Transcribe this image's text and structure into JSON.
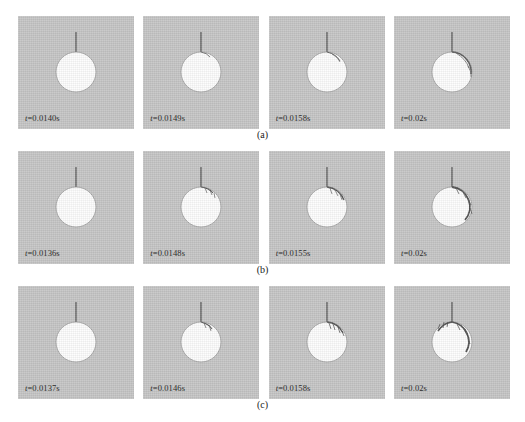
{
  "figure": {
    "type": "image-sequence-grid",
    "rows": 3,
    "columns": 4,
    "panel_background_color": "#c6c6c6",
    "bubble_color": "#fdfdfd",
    "needle_color": "#6e6e6e",
    "streamer_color": "#4a4a4a"
  },
  "rows": [
    {
      "caption": "(a)",
      "panels": [
        {
          "time_label": "t =0.0140s",
          "time_prefix": "t",
          "time_value": "=0.0140s",
          "bubble_radius": 20,
          "bubble_cx": 58,
          "bubble_cy": 56,
          "needle_length": 20,
          "arc_extent": "none",
          "streamer_branches": 0
        },
        {
          "time_label": "t =0.0149s",
          "time_prefix": "t",
          "time_value": "=0.0149s",
          "bubble_radius": 20,
          "bubble_cx": 58,
          "bubble_cy": 56,
          "needle_length": 20,
          "arc_extent": "none",
          "streamer_branches": 0
        },
        {
          "time_label": "t =0.0158s",
          "time_prefix": "t",
          "time_value": "=0.0158s",
          "bubble_radius": 20,
          "bubble_cx": 58,
          "bubble_cy": 56,
          "needle_length": 20,
          "arc_extent": "small",
          "streamer_branches": 1
        },
        {
          "time_label": "t =0.02s",
          "time_prefix": "t",
          "time_value": "=0.02s",
          "bubble_radius": 20,
          "bubble_cx": 58,
          "bubble_cy": 56,
          "needle_length": 20,
          "arc_extent": "right",
          "streamer_branches": 2
        }
      ]
    },
    {
      "caption": "(b)",
      "panels": [
        {
          "time_label": "t =0.0136s",
          "time_prefix": "t",
          "time_value": "=0.0136s",
          "bubble_radius": 20,
          "bubble_cx": 58,
          "bubble_cy": 56,
          "needle_length": 20,
          "arc_extent": "none",
          "streamer_branches": 0
        },
        {
          "time_label": "t =0.0148s",
          "time_prefix": "t",
          "time_value": "=0.0148s",
          "bubble_radius": 20,
          "bubble_cx": 58,
          "bubble_cy": 56,
          "needle_length": 20,
          "arc_extent": "small",
          "streamer_branches": 2
        },
        {
          "time_label": "t =0.0155s",
          "time_prefix": "t",
          "time_value": "=0.0155s",
          "bubble_radius": 20,
          "bubble_cx": 58,
          "bubble_cy": 56,
          "needle_length": 20,
          "arc_extent": "medium",
          "streamer_branches": 3
        },
        {
          "time_label": "t =0.02s",
          "time_prefix": "t",
          "time_value": "=0.02s",
          "bubble_radius": 20,
          "bubble_cx": 58,
          "bubble_cy": 56,
          "needle_length": 20,
          "arc_extent": "large-right",
          "streamer_branches": 4
        }
      ]
    },
    {
      "caption": "(c)",
      "panels": [
        {
          "time_label": "t =0.0137s",
          "time_prefix": "t",
          "time_value": "=0.0137s",
          "bubble_radius": 20,
          "bubble_cx": 58,
          "bubble_cy": 56,
          "needle_length": 20,
          "arc_extent": "none",
          "streamer_branches": 0
        },
        {
          "time_label": "t =0.0146s",
          "time_prefix": "t",
          "time_value": "=0.0146s",
          "bubble_radius": 20,
          "bubble_cx": 58,
          "bubble_cy": 56,
          "needle_length": 20,
          "arc_extent": "small",
          "streamer_branches": 2
        },
        {
          "time_label": "t =0.0158s",
          "time_prefix": "t",
          "time_value": "=0.0158s",
          "bubble_radius": 20,
          "bubble_cx": 58,
          "bubble_cy": 56,
          "needle_length": 20,
          "arc_extent": "medium",
          "streamer_branches": 4
        },
        {
          "time_label": "t =0.02s",
          "time_prefix": "t",
          "time_value": "=0.02s",
          "bubble_radius": 20,
          "bubble_cx": 58,
          "bubble_cy": 56,
          "needle_length": 20,
          "arc_extent": "large-both",
          "streamer_branches": 6
        }
      ]
    }
  ]
}
